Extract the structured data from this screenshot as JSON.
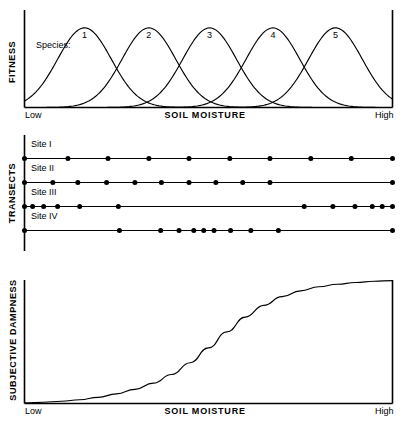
{
  "figure": {
    "panels": {
      "fitness": {
        "y_axis_label": "FITNESS",
        "x_axis_label": "SOIL  MOISTURE",
        "x_low_label": "Low",
        "x_high_label": "High",
        "series_legend_label": "Species:",
        "species_numbers": [
          "1",
          "2",
          "3",
          "4",
          "5"
        ]
      },
      "transects": {
        "y_axis_label": "TRANSECTS",
        "rows": [
          {
            "label": "Site I"
          },
          {
            "label": "Site II"
          },
          {
            "label": "Site III"
          },
          {
            "label": "Site IV"
          }
        ]
      },
      "dampness": {
        "y_axis_label": "SUBJECTIVE DAMPNESS",
        "x_axis_label": "SOIL  MOISTURE",
        "x_low_label": "Low",
        "x_high_label": "High"
      }
    }
  },
  "chart_data": [
    {
      "type": "line",
      "id": "fitness-curves",
      "title": "",
      "xlabel": "SOIL  MOISTURE",
      "ylabel": "FITNESS",
      "xlim": [
        0,
        1
      ],
      "ylim": [
        0,
        1
      ],
      "xticklabels": [
        "Low",
        "High"
      ],
      "grid": false,
      "legend": "inline-numeric-labels-above-peaks",
      "annotation": "Species:",
      "series": [
        {
          "name": "1",
          "peak_x": 0.163,
          "peak_y": 0.88,
          "sigma": 0.073
        },
        {
          "name": "2",
          "peak_x": 0.338,
          "peak_y": 0.88,
          "sigma": 0.073
        },
        {
          "name": "3",
          "peak_x": 0.503,
          "peak_y": 0.88,
          "sigma": 0.073
        },
        {
          "name": "4",
          "peak_x": 0.675,
          "peak_y": 0.88,
          "sigma": 0.073
        },
        {
          "name": "5",
          "peak_x": 0.845,
          "peak_y": 0.88,
          "sigma": 0.073
        }
      ]
    },
    {
      "type": "scatter",
      "id": "transect-sample-points",
      "title": "",
      "xlabel": "",
      "ylabel": "TRANSECTS",
      "xlim": [
        0,
        1
      ],
      "grid": false,
      "series": [
        {
          "name": "Site I",
          "x": [
            0.0,
            0.118,
            0.227,
            0.338,
            0.447,
            0.558,
            0.667,
            0.778,
            0.888,
            1.0
          ]
        },
        {
          "name": "Site II",
          "x": [
            0.0,
            0.077,
            0.145,
            0.223,
            0.3,
            0.372,
            0.447,
            0.52,
            0.593,
            0.667,
            1.0
          ]
        },
        {
          "name": "Site III",
          "x": [
            0.0,
            0.022,
            0.052,
            0.09,
            0.15,
            0.255,
            0.76,
            0.838,
            0.898,
            0.945,
            0.972,
            1.0
          ]
        },
        {
          "name": "Site IV",
          "x": [
            0.0,
            0.258,
            0.37,
            0.42,
            0.46,
            0.487,
            0.515,
            0.56,
            0.615,
            0.69,
            1.0
          ]
        }
      ]
    },
    {
      "type": "line",
      "id": "subjective-dampness",
      "title": "",
      "xlabel": "SOIL  MOISTURE",
      "ylabel": "SUBJECTIVE DAMPNESS",
      "xlim": [
        0,
        1
      ],
      "ylim": [
        0,
        1
      ],
      "xticklabels": [
        "Low",
        "High"
      ],
      "grid": false,
      "curve": "sigmoid",
      "inflection_x": 0.52,
      "steepness": 9.0,
      "points": [
        [
          0.0,
          0.005
        ],
        [
          0.05,
          0.01
        ],
        [
          0.1,
          0.018
        ],
        [
          0.15,
          0.03
        ],
        [
          0.2,
          0.05
        ],
        [
          0.25,
          0.078
        ],
        [
          0.3,
          0.115
        ],
        [
          0.35,
          0.165
        ],
        [
          0.4,
          0.235
        ],
        [
          0.45,
          0.33
        ],
        [
          0.5,
          0.45
        ],
        [
          0.55,
          0.58
        ],
        [
          0.6,
          0.7
        ],
        [
          0.65,
          0.795
        ],
        [
          0.7,
          0.865
        ],
        [
          0.75,
          0.912
        ],
        [
          0.8,
          0.945
        ],
        [
          0.85,
          0.966
        ],
        [
          0.9,
          0.98
        ],
        [
          0.95,
          0.99
        ],
        [
          1.0,
          0.995
        ]
      ]
    }
  ],
  "style": {
    "stroke_color": "#000000",
    "background_color": "#ffffff",
    "dot_color": "#000000"
  }
}
